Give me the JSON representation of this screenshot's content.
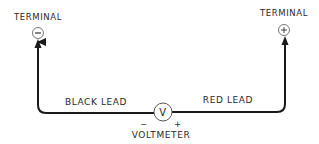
{
  "diagram": {
    "terminal_negative": {
      "label": "TERMINAL",
      "symbol": "−"
    },
    "terminal_positive": {
      "label": "TERMINAL",
      "symbol": "+"
    },
    "meter": {
      "symbol": "V",
      "label": "VOLTMETER",
      "negative_mark": "−",
      "positive_mark": "+"
    },
    "leads": {
      "black": "BLACK LEAD",
      "red": "RED LEAD"
    },
    "colors": {
      "line": "#1a1a1a",
      "text": "#2a2a2a",
      "background": "#ffffff"
    }
  }
}
